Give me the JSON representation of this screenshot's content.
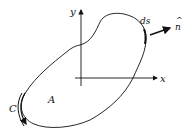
{
  "diagram": {
    "type": "closed curve region with coordinate axes",
    "labels": {
      "y_axis": "y",
      "x_axis": "x",
      "arc_element": "ds",
      "normal": "n",
      "normal_hat": "^",
      "region": "A",
      "curve": "C"
    },
    "colors": {
      "stroke": "#111111",
      "background": "#ffffff"
    }
  }
}
